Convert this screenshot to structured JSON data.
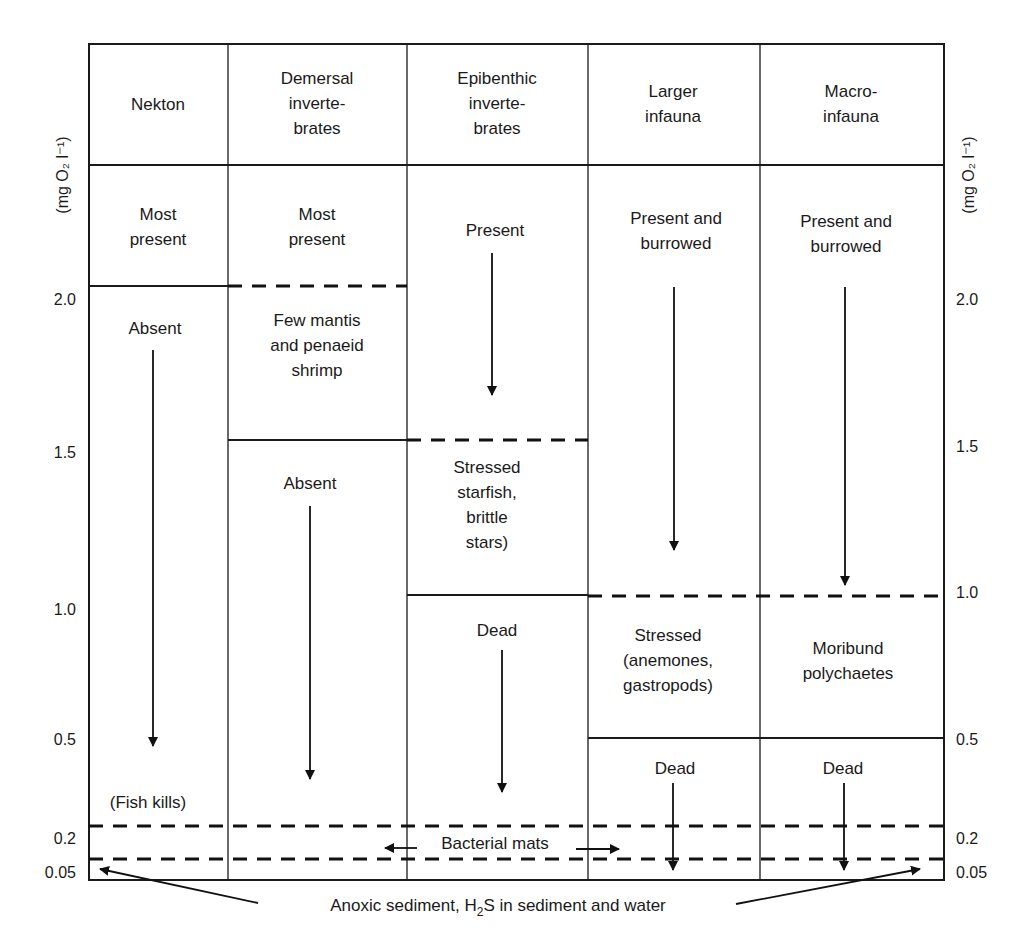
{
  "axis": {
    "units_left": "(mg O₂ l⁻¹)",
    "units_right": "(mg O₂ l⁻¹)",
    "ticks": [
      "2.0",
      "1.5",
      "1.0",
      "0.5",
      "0.2",
      "0.05"
    ]
  },
  "columns": [
    {
      "header": [
        "Nekton"
      ],
      "cells": [
        [
          "Most",
          "present"
        ],
        [
          "Absent"
        ],
        [
          "(Fish kills)"
        ]
      ]
    },
    {
      "header": [
        "Demersal",
        "inverte-",
        "brates"
      ],
      "cells": [
        [
          "Most",
          "present"
        ],
        [
          "Few mantis",
          "and penaeid",
          "shrimp"
        ],
        [
          "Absent"
        ]
      ]
    },
    {
      "header": [
        "Epibenthic",
        "inverte-",
        "brates"
      ],
      "cells": [
        [
          "Present"
        ],
        [
          "Stressed",
          "starfish,",
          "brittle",
          "stars)"
        ],
        [
          "Dead"
        ]
      ]
    },
    {
      "header": [
        "Larger",
        "infauna"
      ],
      "cells": [
        [
          "Present and",
          "burrowed"
        ],
        [
          "Stressed",
          "(anemones,",
          "gastropods)"
        ],
        [
          "Dead"
        ]
      ]
    },
    {
      "header": [
        "Macro-",
        "infauna"
      ],
      "cells": [
        [
          "Present and",
          "burrowed"
        ],
        [
          "Moribund",
          "polychaetes"
        ],
        [
          "Dead"
        ]
      ]
    }
  ],
  "annotations": {
    "bacterial_mats": "Bacterial mats",
    "anoxic_prefix": "Anoxic sediment, H",
    "anoxic_sub": "2",
    "anoxic_suffix": "S in sediment and water"
  }
}
